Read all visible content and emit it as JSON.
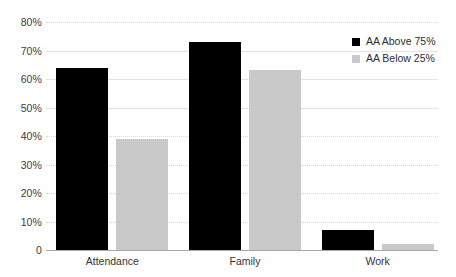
{
  "chart_data": {
    "type": "bar",
    "title": "",
    "subtitle": "",
    "xlabel": "",
    "ylabel": "",
    "categories": [
      "Attendance",
      "Family",
      "Work"
    ],
    "series": [
      {
        "name": "AA Above 75%",
        "color": "#000000",
        "values": [
          64,
          73,
          7
        ]
      },
      {
        "name": "AA Below 25%",
        "color": "#c9c9c9",
        "values": [
          39,
          63,
          2
        ]
      }
    ],
    "ylim": [
      0,
      80
    ],
    "y_ticks": [
      0,
      10,
      20,
      30,
      40,
      50,
      60,
      70,
      80
    ],
    "y_tick_labels": [
      "0",
      "10%",
      "20%",
      "30%",
      "40%",
      "50%",
      "60%",
      "70%",
      "80%"
    ],
    "grid": true,
    "grid_axis": "y",
    "legend_position": "top-right",
    "value_suffix": "%"
  }
}
